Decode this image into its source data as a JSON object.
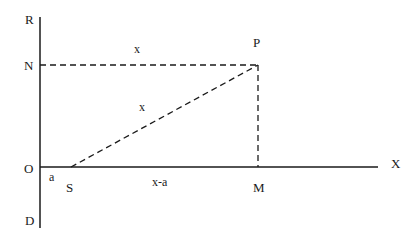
{
  "diagram": {
    "points": {
      "R": "R",
      "N": "N",
      "O": "O",
      "D": "D",
      "P": "P",
      "S": "S",
      "M": "M",
      "X": "X"
    },
    "segment_labels": {
      "NP": "x",
      "SP": "x",
      "OS": "a",
      "SM": "x-a"
    },
    "colors": {
      "line": "#1a1a1a",
      "background": "#ffffff"
    }
  }
}
